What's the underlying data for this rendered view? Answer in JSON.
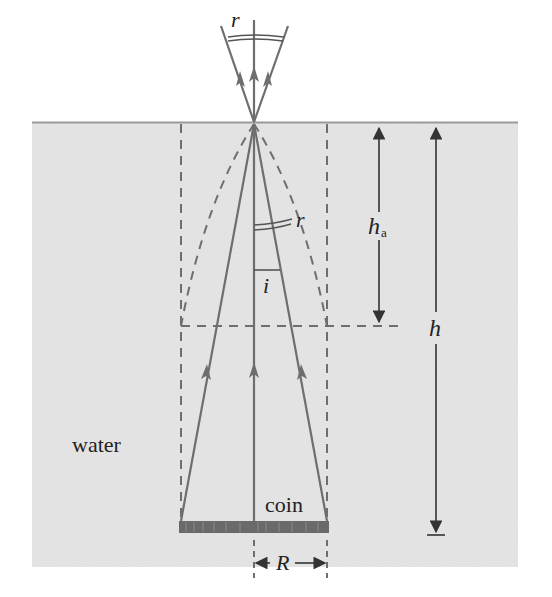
{
  "diagram": {
    "type": "optics-apparent-depth",
    "labels": {
      "angle_refraction_top": "r",
      "angle_refraction_inner": "r",
      "angle_incidence": "i",
      "apparent_depth": "h",
      "apparent_depth_subscript": "a",
      "real_depth": "h",
      "medium": "water",
      "object": "coin",
      "coin_radius": "R"
    },
    "colors": {
      "water": "#e6e6e6",
      "surface_line": "#9a9a9a",
      "rays": "#6e6e6e",
      "dashed": "#6e6e6e",
      "text": "#222222",
      "coin": "#6a6a6a",
      "background": "#ffffff"
    }
  }
}
